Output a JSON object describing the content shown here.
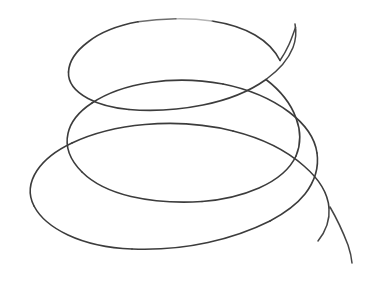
{
  "figure": {
    "title": "Hand-drawn 3D spiral (helix)",
    "subject": "spiral",
    "style": "freehand line drawing",
    "loop_count": 3
  },
  "canvas": {
    "width": 380,
    "height": 304,
    "background_color": "#ffffff"
  },
  "stroke": {
    "color": "#3c3c3c",
    "color_light": "#8d8d8d",
    "width": 1.6,
    "width_light": 1.3,
    "opacity": 1
  },
  "geometry": {
    "loops": [
      {
        "name": "top-loop",
        "order": 1,
        "center_x": 181,
        "center_y": 62,
        "radius_x": 113,
        "radius_y": 43,
        "top_y": 19,
        "bottom_y": 106,
        "left_x": 68,
        "right_x": 294
      },
      {
        "name": "middle-loop",
        "order": 2,
        "center_x": 180,
        "center_y": 140,
        "radius_x": 143,
        "radius_y": 53,
        "top_y": 88,
        "bottom_y": 194,
        "left_x": 46,
        "right_x": 322
      },
      {
        "name": "bottom-loop",
        "order": 3,
        "center_x": 183,
        "center_y": 221,
        "radius_x": 152,
        "radius_y": 62,
        "top_y": 160,
        "bottom_y": 284,
        "left_x": 31,
        "right_x": 335
      }
    ],
    "tails": [
      {
        "name": "start-tail",
        "from_x": 268,
        "from_y": 70,
        "to_x": 296,
        "to_y": 27
      },
      {
        "name": "end-tail",
        "from_x": 320,
        "from_y": 200,
        "to_x": 352,
        "to_y": 263
      }
    ],
    "crossings": [
      {
        "name": "crossing-upper-right",
        "x": 287,
        "y": 52
      },
      {
        "name": "crossing-mid-right",
        "x": 308,
        "y": 128
      },
      {
        "name": "crossing-lower-right",
        "x": 318,
        "y": 199
      },
      {
        "name": "crossing-mid-left",
        "x": 96,
        "y": 103
      },
      {
        "name": "crossing-lower-left",
        "x": 68,
        "y": 180
      }
    ]
  },
  "paths": {
    "spiral_main": "M296,27 C292,40 286,52 278,62 C268,76 252,88 232,96 C208,105 178,109 150,107 C118,105 90,95 76,82 C62,68 64,51 80,38 C98,24 130,17 166,19 C204,21 244,32 268,50 C292,68 300,90 296,110 C291,133 268,153 234,167 C200,181 156,187 116,183 C78,179 52,165 44,147 C36,128 48,107 72,93 C100,77 142,69 186,72 C232,75 276,90 304,113 C330,135 336,162 322,185 C306,210 268,231 220,243 C172,255 118,254 80,240 C44,227 26,204 32,180 C38,155 70,132 116,118 C164,103 222,103 268,118 C312,132 340,160 336,190 C332,219 300,245 352,263",
    "spiral_fallback": ""
  }
}
